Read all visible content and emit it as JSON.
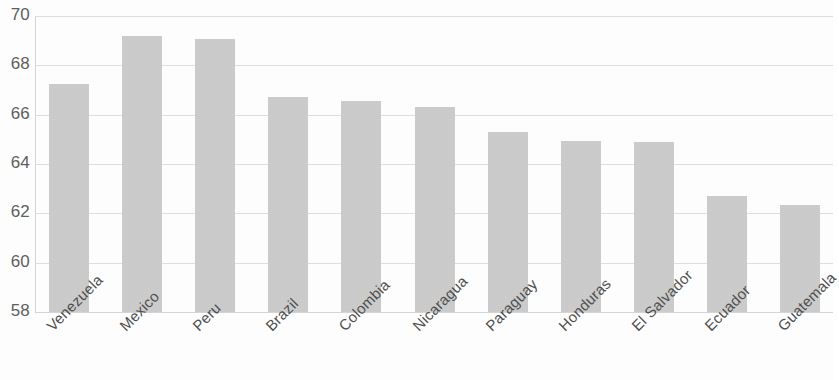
{
  "chart_data": {
    "type": "bar",
    "title": "",
    "subtitle": "",
    "xlabel": "",
    "ylabel": "",
    "ylim": [
      58,
      70
    ],
    "ytick_step": 2,
    "yticks": [
      70,
      68,
      66,
      64,
      62,
      60,
      58
    ],
    "ytick_labels": [
      "70",
      "68",
      "66",
      "64",
      "62",
      "60",
      "58"
    ],
    "grid": true,
    "grid_axis": "y",
    "legend": false,
    "legend_position": "none",
    "bar_color": "#c6c6c6",
    "grid_color": "#dcdee3",
    "axis_color": "#d2d4d8",
    "tick_text_color": "#5e5e5e",
    "category_text_color": "#4f4f4f",
    "category_label_rotation": -45,
    "categories": [
      "Venezuela",
      "Mexico",
      "Peru",
      "Brazil",
      "Colombia",
      "Nicaragua",
      "Paraguay",
      "Honduras",
      "El Salvador",
      "Ecuador",
      "Guatemala"
    ],
    "values": [
      67.25,
      69.2,
      69.05,
      66.7,
      66.55,
      66.3,
      65.3,
      64.95,
      64.9,
      62.7,
      62.35
    ]
  }
}
